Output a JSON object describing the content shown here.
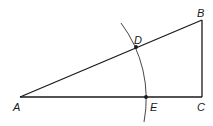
{
  "diagram": {
    "type": "geometric-construction",
    "colors": {
      "line": "#1a1a1a",
      "arc": "#333333",
      "background": "#ffffff"
    },
    "points": {
      "A": {
        "label": "A",
        "x": 20,
        "y": 97
      },
      "B": {
        "label": "B",
        "x": 202,
        "y": 20
      },
      "C": {
        "label": "C",
        "x": 202,
        "y": 97
      },
      "D": {
        "label": "D",
        "x": 136,
        "y": 47
      },
      "E": {
        "label": "E",
        "x": 146,
        "y": 97
      }
    },
    "segments": [
      [
        "A",
        "B"
      ],
      [
        "B",
        "C"
      ],
      [
        "A",
        "C"
      ]
    ],
    "arc": {
      "center": "A",
      "through": [
        "D",
        "E"
      ]
    },
    "marked_points": [
      "D",
      "E"
    ]
  }
}
